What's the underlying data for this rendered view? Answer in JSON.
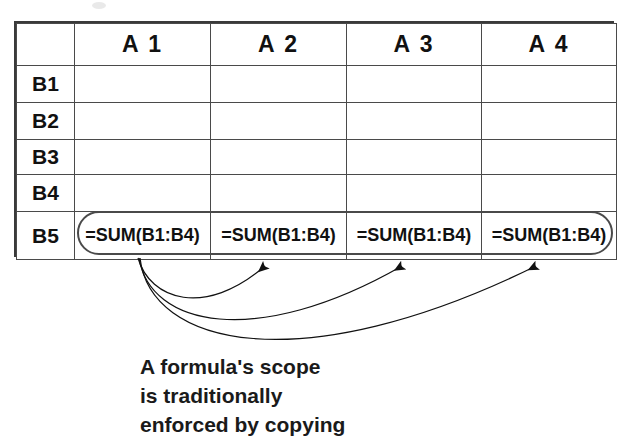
{
  "figure": {
    "kind": "spreadsheet-formula-scope-diagram",
    "width": 630,
    "height": 442,
    "background_color": "#ffffff",
    "ink_color": "#1a1a1a",
    "header_fill_color": "#c9c9c9",
    "grid_line_color": "#4a4a4a"
  },
  "spreadsheet": {
    "corner_label": "",
    "column_headers": [
      "A 1",
      "A 2",
      "A 3",
      "A 4"
    ],
    "row_headers": [
      "B1",
      "B2",
      "B3",
      "B4",
      "B5"
    ],
    "rows": [
      {
        "header": "B1",
        "cells": [
          "",
          "",
          "",
          ""
        ]
      },
      {
        "header": "B2",
        "cells": [
          "",
          "",
          "",
          ""
        ]
      },
      {
        "header": "B3",
        "cells": [
          "",
          "",
          "",
          ""
        ]
      },
      {
        "header": "B4",
        "cells": [
          "",
          "",
          "",
          ""
        ]
      },
      {
        "header": "B5",
        "cells": [
          "=SUM(B1:B4)",
          "=SUM(B1:B4)",
          "=SUM(B1:B4)",
          "=SUM(B1:B4)"
        ]
      }
    ],
    "formula_row_index": 4,
    "formula_text": "=SUM(B1:B4)",
    "selection_ring": {
      "shape": "rounded-rectangle",
      "spans_row": "B5",
      "spans_columns": [
        "A 1",
        "A 2",
        "A 3",
        "A 4"
      ]
    }
  },
  "annotations": {
    "arrow_count": 3,
    "arrows": [
      {
        "name": "copy-arrow-to-a2",
        "from_cell": "A 1 / B5",
        "to_cell": "A 2 / B5"
      },
      {
        "name": "copy-arrow-to-a3",
        "from_cell": "A 1 / B5",
        "to_cell": "A 3 / B5"
      },
      {
        "name": "copy-arrow-to-a4",
        "from_cell": "A 1 / B5",
        "to_cell": "A 4 / B5"
      }
    ]
  },
  "caption": {
    "lines": [
      "A formula's scope",
      "is traditionally",
      "enforced by copying"
    ],
    "full_text": "A formula's scope is traditionally enforced by copying"
  }
}
